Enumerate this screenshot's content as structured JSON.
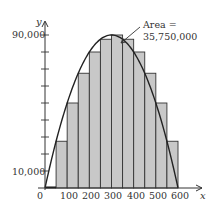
{
  "chart_data": {
    "type": "bar",
    "title": "",
    "xlabel": "x",
    "ylabel": "y",
    "x_ticks": [
      0,
      100,
      200,
      300,
      400,
      500,
      600
    ],
    "x_tick_labels": [
      "0",
      "100",
      "200",
      "300",
      "400",
      "500",
      "600"
    ],
    "y_tick_labels_shown": [
      "10,000",
      "90,000"
    ],
    "y_ticks": [
      10000,
      20000,
      30000,
      40000,
      50000,
      60000,
      70000,
      80000,
      90000
    ],
    "xlim": [
      0,
      600
    ],
    "ylim": [
      0,
      90000
    ],
    "grid": false,
    "bar_width": 50,
    "bars": {
      "x_left": [
        0,
        50,
        100,
        150,
        200,
        250,
        300,
        350,
        400,
        450,
        500,
        550
      ],
      "heights": [
        0,
        27500,
        50000,
        67500,
        80000,
        87500,
        90000,
        87500,
        80000,
        67500,
        50000,
        27500
      ]
    },
    "curve": {
      "equation": "y = 600x - x^2",
      "x": [
        0,
        50,
        100,
        150,
        200,
        250,
        300,
        350,
        400,
        450,
        500,
        550,
        600
      ],
      "y": [
        0,
        27500,
        50000,
        67500,
        80000,
        87500,
        90000,
        87500,
        80000,
        67500,
        50000,
        27500,
        0
      ]
    },
    "annotation": {
      "line1": "Area =",
      "line2": "35,750,000"
    }
  },
  "labels": {
    "y_axis": "y",
    "x_axis": "x",
    "y_top": "90,000",
    "y_low": "10,000",
    "x0": "0",
    "x100": "100",
    "x200": "200",
    "x300": "300",
    "x400": "400",
    "x500": "500",
    "x600": "600",
    "area1": "Area =",
    "area2": "35,750,000"
  }
}
